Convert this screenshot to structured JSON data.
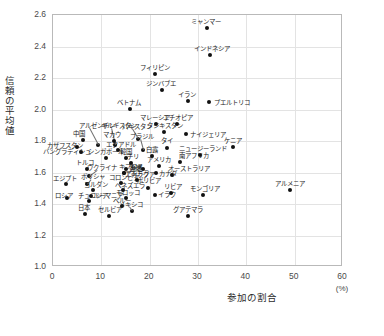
{
  "chart_data": {
    "type": "scatter",
    "title": "",
    "xlabel": "参加の割合",
    "xunit": "(%)",
    "ylabel": "信頼の平均値",
    "xlim": [
      0,
      60
    ],
    "ylim": [
      1.0,
      2.6
    ],
    "xticks": [
      "0",
      "10",
      "20",
      "30",
      "40",
      "50",
      "60"
    ],
    "yticks": [
      "1.0",
      "1.2",
      "1.4",
      "1.6",
      "1.8",
      "2.0",
      "2.2",
      "2.4",
      "2.6"
    ],
    "grid": true,
    "legend": "none",
    "points": [
      {
        "label": "ミャンマー",
        "x": 31.8,
        "y": 2.515,
        "lx": -16,
        "ly": -9
      },
      {
        "label": "インドネシア",
        "x": 32.5,
        "y": 2.345,
        "lx": -16,
        "ly": -9
      },
      {
        "label": "フィリピン",
        "x": 21.0,
        "y": 2.225,
        "lx": -15,
        "ly": -9
      },
      {
        "label": "ジンバブエ",
        "x": 22.5,
        "y": 2.125,
        "lx": -16,
        "ly": -9
      },
      {
        "label": "イラン",
        "x": 28.0,
        "y": 2.055,
        "lx": -10,
        "ly": -9
      },
      {
        "label": "プエルトリコ",
        "x": 32.3,
        "y": 2.045,
        "lx": 5,
        "ly": -2
      },
      {
        "label": "ベトナム",
        "x": 16.0,
        "y": 2.005,
        "lx": -13,
        "ly": -9
      },
      {
        "label": "ケニア",
        "x": 37.3,
        "y": 1.765,
        "lx": -9,
        "ly": -9
      },
      {
        "label": "マレーシア",
        "x": 21.3,
        "y": 1.905,
        "lx": -16,
        "ly": -9
      },
      {
        "label": "エチオピア",
        "x": 25.6,
        "y": 1.905,
        "lx": -14,
        "ly": -9
      },
      {
        "label": "アルゼンチン",
        "x": 9.3,
        "y": 1.775,
        "lx": -19,
        "ly": -22,
        "leader": true
      },
      {
        "label": "キルギスタン",
        "x": 12.8,
        "y": 1.775,
        "lx": -14,
        "ly": -22,
        "leader": true
      },
      {
        "label": "パキスタン",
        "x": 17.5,
        "y": 1.815,
        "lx": -16,
        "ly": -15,
        "leader": true
      },
      {
        "label": "タジキスタン",
        "x": 23.0,
        "y": 1.855,
        "lx": -17,
        "ly": -9
      },
      {
        "label": "ナイジェリア",
        "x": 27.5,
        "y": 1.845,
        "lx": 4,
        "ly": -2
      },
      {
        "label": "ブラジル",
        "x": 18.7,
        "y": 1.745,
        "lx": -13,
        "ly": -16,
        "leader": true
      },
      {
        "label": "タイ",
        "x": 23.6,
        "y": 1.755,
        "lx": -6,
        "ly": -10
      },
      {
        "label": "中国",
        "x": 6.2,
        "y": 1.805,
        "lx": -10,
        "ly": -9
      },
      {
        "label": "マカウ",
        "x": 12.6,
        "y": 1.8,
        "lx": -11,
        "ly": -9
      },
      {
        "label": "カザフスタン",
        "x": 5.0,
        "y": 1.765,
        "lx": -30,
        "ly": -4
      },
      {
        "label": "バングラディシュ",
        "x": 5.8,
        "y": 1.73,
        "lx": -38,
        "ly": -3
      },
      {
        "label": "エクアドル",
        "x": 13.5,
        "y": 1.745,
        "lx": -12,
        "ly": -8
      },
      {
        "label": "ニュージーランド",
        "x": 30.5,
        "y": 1.71,
        "lx": -21,
        "ly": -9
      },
      {
        "label": "シンガポール",
        "x": 10.9,
        "y": 1.695,
        "lx": -18,
        "ly": -9
      },
      {
        "label": "韓国",
        "x": 15.0,
        "y": 1.69,
        "lx": -6,
        "ly": -9
      },
      {
        "label": "白露",
        "x": 20.4,
        "y": 1.705,
        "lx": -6,
        "ly": -9
      },
      {
        "label": "南アフリカ",
        "x": 26.2,
        "y": 1.665,
        "lx": -1,
        "ly": -9
      },
      {
        "label": "アメリカ",
        "x": 22.0,
        "y": 1.64,
        "lx": -12,
        "ly": -9
      },
      {
        "label": "台湾",
        "x": 18.7,
        "y": 1.62,
        "lx": -13,
        "ly": -3
      },
      {
        "label": "カナダ",
        "x": 21.4,
        "y": 1.595,
        "lx": 3,
        "ly": -2
      },
      {
        "label": "オーストラリア",
        "x": 24.6,
        "y": 1.585,
        "lx": -4,
        "ly": -9
      },
      {
        "label": "トルコ",
        "x": 7.0,
        "y": 1.625,
        "lx": -11,
        "ly": -9
      },
      {
        "label": "ウクライナ",
        "x": 7.4,
        "y": 1.575,
        "lx": -2,
        "ly": -11,
        "leader": true
      },
      {
        "label": "キプロス",
        "x": 14.6,
        "y": 1.6,
        "lx": -5,
        "ly": -9
      },
      {
        "label": "エジプト",
        "x": 2.6,
        "y": 1.53,
        "lx": -13,
        "ly": -8
      },
      {
        "label": "ポリシャ",
        "x": 7.0,
        "y": 1.525,
        "lx": -6,
        "ly": -10,
        "leader": true
      },
      {
        "label": "コロンビア",
        "x": 14.0,
        "y": 1.535,
        "lx": -12,
        "ly": -8
      },
      {
        "label": "ヨルダン",
        "x": 8.2,
        "y": 1.49,
        "lx": -9,
        "ly": -8
      },
      {
        "label": "ベネズエラ",
        "x": 14.4,
        "y": 1.49,
        "lx": -8,
        "ly": -7
      },
      {
        "label": "ボリビア",
        "x": 19.6,
        "y": 1.5,
        "lx": -11,
        "ly": -10
      },
      {
        "label": "ロシア",
        "x": 2.9,
        "y": 1.44,
        "lx": -12,
        "ly": -5
      },
      {
        "label": "ルーマニア",
        "x": 7.9,
        "y": 1.45,
        "lx": 2,
        "ly": -3
      },
      {
        "label": "チュニジア",
        "x": 7.4,
        "y": 1.42,
        "lx": -11,
        "ly": -8
      },
      {
        "label": "モロッコ",
        "x": 15.2,
        "y": 1.44,
        "lx": -10,
        "ly": -8
      },
      {
        "label": "イラク",
        "x": 21.0,
        "y": 1.455,
        "lx": 3,
        "ly": -3
      },
      {
        "label": "リビア",
        "x": 24.4,
        "y": 1.47,
        "lx": -7,
        "ly": -9
      },
      {
        "label": "モンゴリア",
        "x": 31.0,
        "y": 1.455,
        "lx": -13,
        "ly": -9
      },
      {
        "label": "ペルー",
        "x": 14.3,
        "y": 1.385,
        "lx": -9,
        "ly": -8
      },
      {
        "label": "メキシコ",
        "x": 16.3,
        "y": 1.355,
        "lx": -13,
        "ly": -9,
        "leader": true
      },
      {
        "label": "グアテマラ",
        "x": 28.0,
        "y": 1.325,
        "lx": -15,
        "ly": -9
      },
      {
        "label": "日本",
        "x": 6.6,
        "y": 1.335,
        "lx": -7,
        "ly": -9
      },
      {
        "label": "セルビア",
        "x": 11.6,
        "y": 1.325,
        "lx": -11,
        "ly": -9
      },
      {
        "label": "チリ",
        "x": 16.2,
        "y": 1.66,
        "lx": -4,
        "ly": -9
      },
      {
        "label": "香港",
        "x": 15.2,
        "y": 1.625,
        "lx": 3,
        "ly": -3
      },
      {
        "label": "アンドラ",
        "x": 14.6,
        "y": 1.595,
        "lx": 1,
        "ly": -2
      },
      {
        "label": "ニカラグア",
        "x": 17.4,
        "y": 1.555,
        "lx": -12,
        "ly": -8
      },
      {
        "label": "アルメニア",
        "x": 49.0,
        "y": 1.49,
        "lx": -15,
        "ly": -9
      }
    ]
  }
}
